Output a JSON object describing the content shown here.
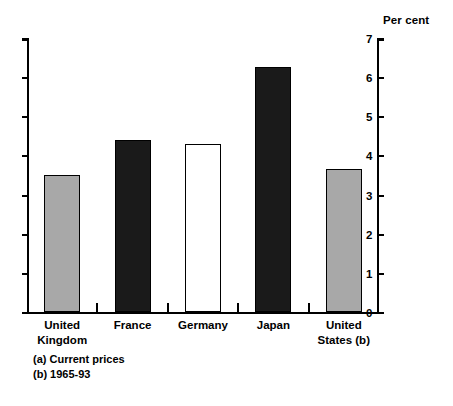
{
  "chart_data": {
    "type": "bar",
    "title": "",
    "subtitle": "",
    "xlabel": "",
    "ylabel": "Per cent",
    "ylim": [
      0,
      7
    ],
    "yticks": [
      0,
      1,
      2,
      3,
      4,
      5,
      6,
      7
    ],
    "ytick_labels": [
      "0",
      "1",
      "2",
      "3",
      "4",
      "5",
      "6",
      "7"
    ],
    "grid": false,
    "legend": null,
    "categories": [
      "United\nKingdom",
      "France",
      "Germany",
      "Japan",
      "United\nStates (b)"
    ],
    "values": [
      3.5,
      4.4,
      4.3,
      6.25,
      3.65
    ],
    "bar_styles": [
      "gray",
      "black",
      "white",
      "black",
      "gray"
    ],
    "annotations": [
      "(a) Current prices",
      "(b) 1965-93"
    ],
    "colors": {
      "black_fill": "#1a1a1a",
      "gray_fill": "#a8a8a8",
      "white_fill": "#ffffff",
      "outline": "#000000",
      "background": "#ffffff"
    }
  },
  "axis": {
    "title": "Per cent"
  },
  "footnotes": [
    {
      "text": "(a) Current prices"
    },
    {
      "text": "(b) 1965-93"
    }
  ]
}
